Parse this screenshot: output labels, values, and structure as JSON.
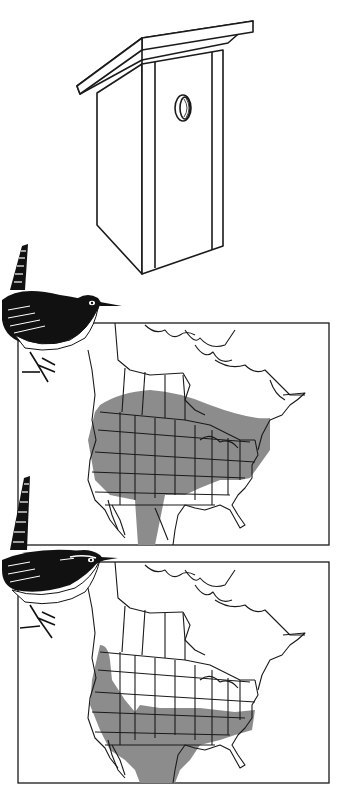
{
  "illustration": {
    "background_color": "#ffffff",
    "line_color": "#1a1a1a",
    "range_fill_color": "#8c8c8c",
    "birdhouse": {
      "label": "birdhouse",
      "entrance_hole": "round entrance hole"
    },
    "maps": [
      {
        "label": "range map 1",
        "region": "North America",
        "bird": "wren (upper)",
        "range_description": "shaded band across southern Canada and most of the United States, extending into northern Mexico"
      },
      {
        "label": "range map 2",
        "region": "North America",
        "bird": "wren (lower)",
        "range_description": "shaded area across southern United States, California coast and much of Mexico"
      }
    ]
  }
}
